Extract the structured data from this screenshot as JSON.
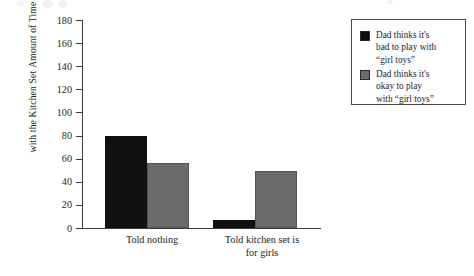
{
  "chart_data": {
    "type": "bar",
    "title": "",
    "subtitle": "",
    "xlabel": "",
    "ylabel": "Amount of Time Spent Playing with the Kitchen Set",
    "ylabel_lines": [
      "Amount of Time Spent Playing",
      "with the Kitchen Set"
    ],
    "categories": [
      "Told nothing",
      "Told kitchen set is for girls"
    ],
    "category_lines": [
      [
        "Told nothing"
      ],
      [
        "Told kitchen set is",
        "for girls"
      ]
    ],
    "series": [
      {
        "name": "Dad thinks it's bad to play with “girl toys”",
        "color": "#111111",
        "values": [
          80,
          7
        ]
      },
      {
        "name": "Dad thinks it's okay to play with “girl toys”",
        "color": "#6b6b6b",
        "values": [
          56,
          49
        ]
      }
    ],
    "ylim": [
      0,
      180
    ],
    "ytick_step": 20,
    "yticks": [
      0,
      20,
      40,
      60,
      80,
      100,
      120,
      140,
      160,
      180
    ],
    "ytick_labels": [
      "0",
      "20",
      "40",
      "60",
      "80",
      "100",
      "120",
      "140",
      "160",
      "180"
    ],
    "grid": false,
    "legend_position": "right"
  },
  "legend": {
    "entries": [
      {
        "swatch": "#111111",
        "label": "Dad thinks it's\nbad to play with\n“girl toys”"
      },
      {
        "swatch": "#6b6b6b",
        "label": "Dad thinks it's\nokay to play\nwith “girl toys”"
      }
    ]
  }
}
